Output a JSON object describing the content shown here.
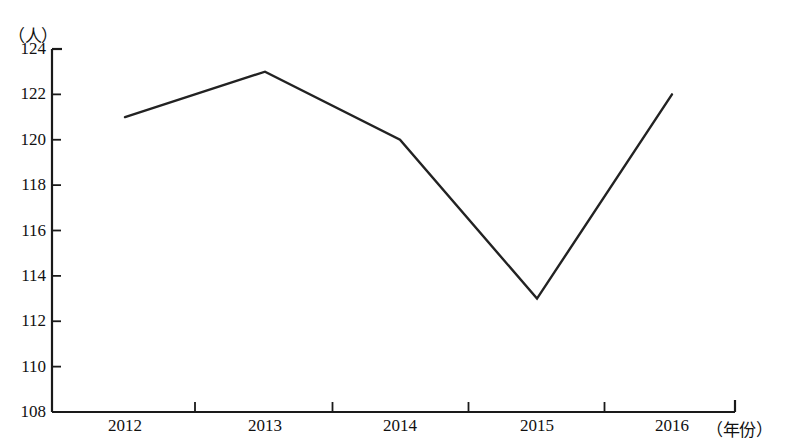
{
  "chart_data": {
    "type": "line",
    "title": "",
    "xlabel": "（年份）",
    "ylabel": "（人）",
    "categories": [
      "2012",
      "2013",
      "2014",
      "2015",
      "2016"
    ],
    "values": [
      121,
      123,
      120,
      113,
      122
    ],
    "series": [
      {
        "name": "",
        "values": [
          121,
          123,
          120,
          113,
          122
        ]
      }
    ],
    "ylim": [
      108,
      124
    ],
    "ytick_step": 2,
    "yticks": [
      108,
      110,
      112,
      114,
      116,
      118,
      120,
      122,
      124
    ],
    "ytick_labels": [
      "108",
      "110",
      "112",
      "114",
      "116",
      "118",
      "120",
      "122",
      "124"
    ],
    "xticks": [
      "2012",
      "2013",
      "2014",
      "2015",
      "2016"
    ],
    "grid": false,
    "legend": false,
    "legend_position": "none",
    "markers": false,
    "line_color": "#222222",
    "axis_color": "#1a1a1a",
    "background_color": "#ffffff"
  },
  "axes": {
    "y_unit_label": "（人）",
    "x_unit_label": "（年份）"
  }
}
